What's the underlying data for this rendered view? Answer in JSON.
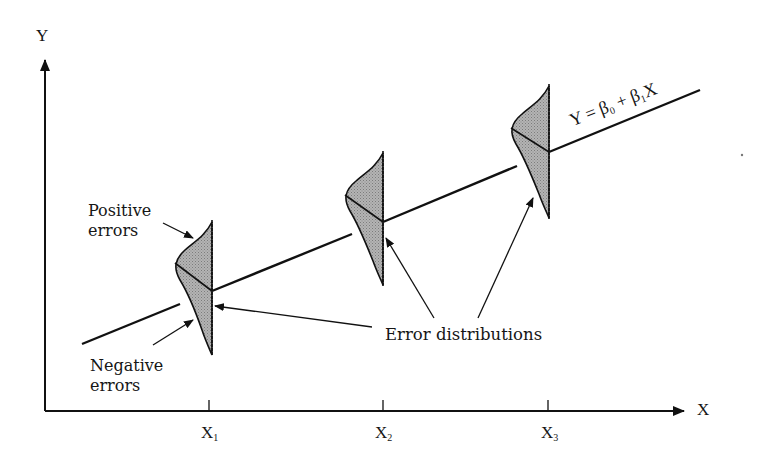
{
  "diagram": {
    "type": "regression-error-distributions",
    "axes": {
      "y_label": "Y",
      "x_label": "X"
    },
    "ticks": [
      {
        "base": "X",
        "sub": "1"
      },
      {
        "base": "X",
        "sub": "2"
      },
      {
        "base": "X",
        "sub": "3"
      }
    ],
    "regression_line": {
      "eq_prefix": "Y = β",
      "eq_sub0": "0",
      "eq_mid": " + β",
      "eq_sub1": "1",
      "eq_suffix": "X"
    },
    "annotations": {
      "positive_line1": "Positive",
      "positive_line2": "errors",
      "negative_line1": "Negative",
      "negative_line2": "errors",
      "error_distributions": "Error distributions"
    },
    "colors": {
      "ink": "#111111",
      "fill": "#a9a9a9"
    }
  }
}
